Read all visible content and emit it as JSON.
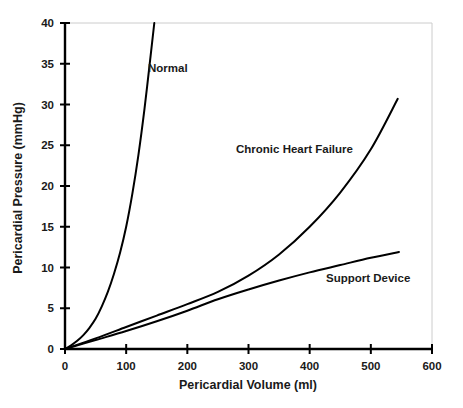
{
  "chart_data": {
    "type": "line",
    "title": "",
    "xlabel": "Pericardial Volume (ml)",
    "ylabel": "Pericardial Pressure (mmHg)",
    "xlim": [
      0,
      600
    ],
    "ylim": [
      0,
      40
    ],
    "xticks": [
      0,
      100,
      200,
      300,
      400,
      500,
      600
    ],
    "yticks": [
      0,
      5,
      10,
      15,
      20,
      25,
      30,
      35,
      40
    ],
    "xtick_labels": [
      "0",
      "100",
      "200",
      "300",
      "400",
      "500",
      "600"
    ],
    "ytick_labels": [
      "0",
      "5",
      "10",
      "15",
      "20",
      "25",
      "30",
      "35",
      "40"
    ],
    "grid": false,
    "legend_position": "inline-annotations",
    "series": [
      {
        "name": "Normal",
        "label": "Normal",
        "color": "#000000",
        "label_x": 148,
        "label_y": 72,
        "points": [
          [
            0,
            0
          ],
          [
            10,
            0.45
          ],
          [
            20,
            1.0
          ],
          [
            30,
            1.7
          ],
          [
            40,
            2.6
          ],
          [
            50,
            3.7
          ],
          [
            60,
            5.2
          ],
          [
            70,
            7.0
          ],
          [
            80,
            9.2
          ],
          [
            90,
            11.8
          ],
          [
            100,
            15.0
          ],
          [
            110,
            19.0
          ],
          [
            120,
            23.8
          ],
          [
            130,
            29.5
          ],
          [
            140,
            36.0
          ],
          [
            146,
            40.0
          ]
        ]
      },
      {
        "name": "Chronic Heart Failure",
        "label": "Chronic Heart Failure",
        "color": "#000000",
        "label_x": 236,
        "label_y": 153,
        "points": [
          [
            0,
            0
          ],
          [
            50,
            1.3
          ],
          [
            100,
            2.7
          ],
          [
            150,
            4.1
          ],
          [
            200,
            5.5
          ],
          [
            250,
            7.0
          ],
          [
            300,
            9.0
          ],
          [
            350,
            11.6
          ],
          [
            400,
            15.0
          ],
          [
            450,
            19.2
          ],
          [
            500,
            24.5
          ],
          [
            544,
            30.7
          ]
        ]
      },
      {
        "name": "Support Device",
        "label": "Support Device",
        "color": "#000000",
        "label_x": 326,
        "label_y": 282,
        "points": [
          [
            0,
            0
          ],
          [
            50,
            1.1
          ],
          [
            100,
            2.2
          ],
          [
            150,
            3.4
          ],
          [
            200,
            4.7
          ],
          [
            250,
            6.1
          ],
          [
            300,
            7.3
          ],
          [
            350,
            8.4
          ],
          [
            400,
            9.4
          ],
          [
            450,
            10.3
          ],
          [
            500,
            11.2
          ],
          [
            546,
            11.9
          ]
        ]
      }
    ]
  }
}
